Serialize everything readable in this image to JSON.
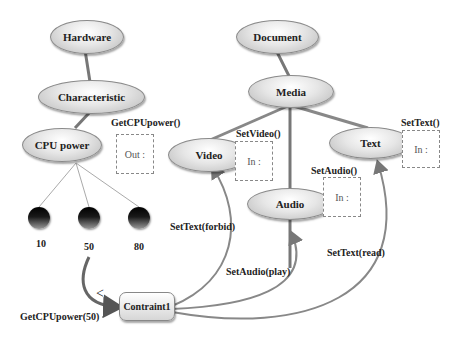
{
  "nodes": {
    "hardware": "Hardware",
    "characteristic": "Characteristic",
    "cpu_power": "CPU power",
    "document": "Document",
    "media": "Media",
    "video": "Video",
    "audio": "Audio",
    "text": "Text",
    "constraint": "Contraint1"
  },
  "values": [
    "10",
    "50",
    "80"
  ],
  "ports": {
    "get_cpu_power": {
      "label": "GetCPUpower()",
      "box": "Out :"
    },
    "set_video": {
      "label": "SetVideo()",
      "box": "In :"
    },
    "set_audio": {
      "label": "SetAudio()",
      "box": "In :"
    },
    "set_text": {
      "label": "SetText()",
      "box": "In :"
    }
  },
  "edge_labels": {
    "set_text_forbid": "SetText(forbid)",
    "set_audio_play": "SetAudio(play)",
    "set_text_read": "SetText(read)",
    "get_cpu_power_50": "GetCPUpower(50)",
    "less_than": "<"
  }
}
